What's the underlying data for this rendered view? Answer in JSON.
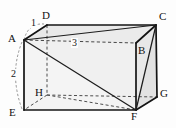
{
  "figure": {
    "type": "geometry-diagram",
    "shape": "rectangular-prism",
    "background_color": "#fdfdfd",
    "stroke_color": "#1a1a1a",
    "hidden_edge_color": "#4a4a4a",
    "face_fill_light": "#f2f2f2",
    "face_fill_mid": "#e8e8e8",
    "face_fill_dark": "#dcdcdc",
    "vertices": [
      {
        "id": "A",
        "label": "A",
        "x": 24,
        "y": 40,
        "label_x": 8,
        "label_y": 34,
        "hidden": false
      },
      {
        "id": "B",
        "label": "B",
        "x": 136,
        "y": 43,
        "label_x": 139,
        "label_y": 47,
        "hidden": false
      },
      {
        "id": "C",
        "label": "C",
        "x": 156,
        "y": 25,
        "label_x": 159,
        "label_y": 13,
        "hidden": false
      },
      {
        "id": "D",
        "label": "D",
        "x": 47,
        "y": 25,
        "label_x": 43,
        "label_y": 12,
        "hidden": false
      },
      {
        "id": "E",
        "label": "E",
        "x": 24,
        "y": 110,
        "label_x": 10,
        "label_y": 111,
        "hidden": false
      },
      {
        "id": "F",
        "label": "F",
        "x": 136,
        "y": 110,
        "label_x": 133,
        "label_y": 113,
        "hidden": false
      },
      {
        "id": "G",
        "label": "G",
        "x": 157,
        "y": 97,
        "label_x": 160,
        "label_y": 91,
        "hidden": false
      },
      {
        "id": "H",
        "label": "H",
        "x": 47,
        "y": 95,
        "label_x": 36,
        "label_y": 89,
        "hidden": true
      }
    ],
    "dimension_labels": [
      {
        "id": "edge-AD",
        "text": "1",
        "x": 32,
        "y": 22,
        "edge": "A-D"
      },
      {
        "id": "edge-AE",
        "text": "2",
        "x": 12,
        "y": 74,
        "edge": "A-E"
      },
      {
        "id": "edge-AB",
        "text": "3",
        "x": 74,
        "y": 45,
        "edge": "A-B"
      }
    ],
    "edges_solid": [
      "A-B",
      "A-D",
      "A-E",
      "D-C",
      "C-B",
      "C-G",
      "B-F",
      "E-F",
      "F-G"
    ],
    "edges_hidden": [
      "D-H",
      "H-E",
      "H-G",
      "A-B"
    ],
    "diagonals": [
      "A-C",
      "A-F",
      "C-F"
    ]
  }
}
